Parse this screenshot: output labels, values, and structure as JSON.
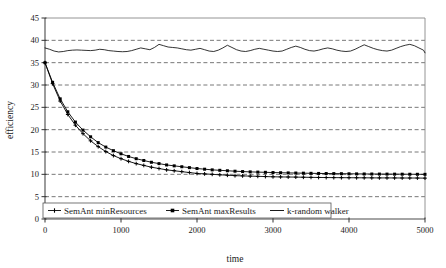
{
  "chart_data": {
    "type": "line",
    "title": "",
    "xlabel": "time",
    "ylabel": "efficiency",
    "xlim": [
      0,
      5000
    ],
    "ylim": [
      0,
      45
    ],
    "xticks": [
      0,
      1000,
      2000,
      3000,
      4000,
      5000
    ],
    "yticks": [
      0,
      5,
      10,
      15,
      20,
      25,
      30,
      35,
      40,
      45
    ],
    "xtick_labels": [
      "0",
      "1000",
      "2000",
      "3000",
      "4000",
      "5000"
    ],
    "ytick_labels": [
      "0",
      "5",
      "10",
      "15",
      "20",
      "25",
      "30",
      "35",
      "40",
      "45"
    ],
    "grid": "horizontal-dashed",
    "legend_position": "bottom-left-inside",
    "series": [
      {
        "name": "SemAnt minResources",
        "marker": "cross",
        "color": "#000000",
        "x": [
          0,
          100,
          200,
          300,
          400,
          500,
          600,
          700,
          800,
          900,
          1000,
          1100,
          1200,
          1300,
          1400,
          1500,
          1600,
          1700,
          1800,
          1900,
          2000,
          2100,
          2200,
          2300,
          2400,
          2500,
          2600,
          2700,
          2800,
          2900,
          3000,
          3100,
          3200,
          3300,
          3400,
          3500,
          3600,
          3700,
          3800,
          3900,
          4000,
          4100,
          4200,
          4300,
          4400,
          4500,
          4600,
          4700,
          4800,
          4900,
          5000
        ],
        "y": [
          35.0,
          30.3,
          26.4,
          23.4,
          21.0,
          19.1,
          17.5,
          16.2,
          15.1,
          14.2,
          13.5,
          12.9,
          12.4,
          12.0,
          11.6,
          11.3,
          11.0,
          10.8,
          10.6,
          10.4,
          10.2,
          10.1,
          10.0,
          9.9,
          9.8,
          9.7,
          9.65,
          9.6,
          9.55,
          9.5,
          9.45,
          9.42,
          9.4,
          9.38,
          9.35,
          9.32,
          9.3,
          9.28,
          9.26,
          9.25,
          9.24,
          9.23,
          9.22,
          9.21,
          9.2,
          9.2,
          9.19,
          9.18,
          9.18,
          9.17,
          9.15
        ]
      },
      {
        "name": "SemAnt maxResults",
        "marker": "square",
        "color": "#000000",
        "x": [
          0,
          100,
          200,
          300,
          400,
          500,
          600,
          700,
          800,
          900,
          1000,
          1100,
          1200,
          1300,
          1400,
          1500,
          1600,
          1700,
          1800,
          1900,
          2000,
          2100,
          2200,
          2300,
          2400,
          2500,
          2600,
          2700,
          2800,
          2900,
          3000,
          3100,
          3200,
          3300,
          3400,
          3500,
          3600,
          3700,
          3800,
          3900,
          4000,
          4100,
          4200,
          4300,
          4400,
          4500,
          4600,
          4700,
          4800,
          4900,
          5000
        ],
        "y": [
          35.0,
          30.6,
          26.9,
          24.0,
          21.7,
          19.9,
          18.4,
          17.1,
          16.1,
          15.3,
          14.6,
          14.0,
          13.5,
          13.1,
          12.7,
          12.4,
          12.1,
          11.9,
          11.7,
          11.5,
          11.3,
          11.15,
          11.0,
          10.9,
          10.8,
          10.7,
          10.62,
          10.55,
          10.5,
          10.45,
          10.4,
          10.36,
          10.32,
          10.29,
          10.26,
          10.23,
          10.2,
          10.18,
          10.16,
          10.14,
          10.12,
          10.1,
          10.08,
          10.07,
          10.06,
          10.05,
          10.04,
          10.03,
          10.02,
          10.01,
          10.0
        ]
      },
      {
        "name": "k-random walker",
        "marker": "none",
        "color": "#000000",
        "x": [
          0,
          60,
          120,
          180,
          240,
          300,
          360,
          420,
          480,
          540,
          600,
          660,
          720,
          780,
          840,
          900,
          960,
          1020,
          1080,
          1140,
          1200,
          1260,
          1320,
          1380,
          1440,
          1500,
          1560,
          1620,
          1680,
          1740,
          1800,
          1860,
          1920,
          1980,
          2040,
          2100,
          2160,
          2220,
          2280,
          2340,
          2400,
          2460,
          2520,
          2580,
          2640,
          2700,
          2760,
          2820,
          2880,
          2940,
          3000,
          3060,
          3120,
          3180,
          3240,
          3300,
          3360,
          3420,
          3480,
          3540,
          3600,
          3660,
          3720,
          3780,
          3840,
          3900,
          3960,
          4020,
          4080,
          4140,
          4200,
          4260,
          4320,
          4380,
          4440,
          4500,
          4560,
          4620,
          4680,
          4740,
          4800,
          4860,
          4920,
          4980,
          5000
        ],
        "y": [
          38.3,
          38.0,
          37.6,
          37.4,
          37.5,
          37.7,
          37.8,
          37.85,
          37.8,
          37.75,
          37.7,
          37.8,
          38.0,
          37.9,
          37.7,
          37.6,
          37.5,
          37.45,
          37.5,
          37.7,
          38.0,
          38.3,
          38.1,
          37.9,
          38.4,
          39.1,
          38.8,
          38.5,
          38.4,
          38.3,
          38.1,
          37.9,
          37.8,
          38.0,
          38.2,
          37.9,
          37.6,
          37.5,
          37.8,
          38.3,
          38.9,
          38.4,
          37.9,
          37.6,
          37.5,
          37.7,
          38.0,
          38.2,
          38.0,
          37.8,
          37.6,
          37.5,
          37.6,
          38.0,
          38.4,
          38.7,
          38.4,
          38.0,
          37.7,
          37.6,
          37.8,
          38.1,
          38.3,
          38.1,
          37.8,
          37.6,
          37.5,
          37.6,
          38.0,
          38.5,
          39.0,
          38.6,
          38.2,
          37.9,
          37.7,
          37.6,
          37.8,
          38.2,
          38.6,
          38.9,
          39.1,
          38.8,
          38.3,
          37.8,
          37.2
        ]
      }
    ]
  },
  "legend": {
    "items": [
      {
        "label": "SemAnt minResources",
        "marker": "cross"
      },
      {
        "label": "SemAnt maxResults",
        "marker": "square"
      },
      {
        "label": "k-random walker",
        "marker": "line"
      }
    ]
  },
  "axes": {
    "x_title": "time",
    "y_title": "efficiency"
  },
  "colors": {
    "line": "#000000",
    "grid": "#555555",
    "frame": "#888888",
    "background": "#ffffff"
  }
}
